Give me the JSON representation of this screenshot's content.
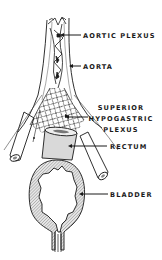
{
  "figure": {
    "type": "anatomical-line-drawing",
    "colors": {
      "ink": "#1a1a1a",
      "background": "#ffffff",
      "hatch_fill": "#bdbdbd",
      "rectum_fill": "#d9d9d9"
    }
  },
  "labels": [
    {
      "id": "aortic-plexus",
      "lines": [
        "AORTIC PLEXUS"
      ]
    },
    {
      "id": "aorta",
      "lines": [
        "AORTA"
      ]
    },
    {
      "id": "superior-hypogastric-plexus",
      "lines": [
        "SUPERIOR",
        "HYPOGASTRIC",
        "PLEXUS"
      ]
    },
    {
      "id": "rectum",
      "lines": [
        "RECTUM"
      ]
    },
    {
      "id": "bladder",
      "lines": [
        "BLADDER"
      ]
    }
  ]
}
